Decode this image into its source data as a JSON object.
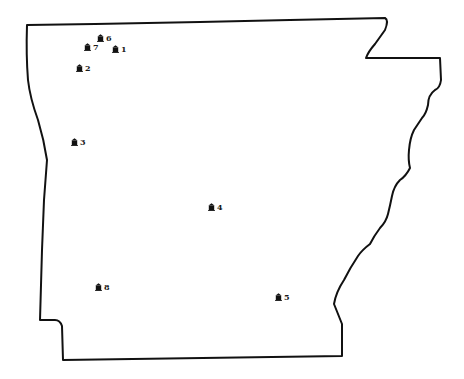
{
  "map": {
    "region": "Arkansas state outline",
    "outline_color": "#111111",
    "background_color": "#ffffff",
    "markers": [
      {
        "id": "1",
        "label": "1",
        "icon": "building-icon",
        "x": 116,
        "y": 49
      },
      {
        "id": "2",
        "label": "2",
        "icon": "building-icon",
        "x": 80,
        "y": 68
      },
      {
        "id": "3",
        "label": "3",
        "icon": "building-icon",
        "x": 75,
        "y": 142
      },
      {
        "id": "4",
        "label": "4",
        "icon": "building-icon",
        "x": 212,
        "y": 207
      },
      {
        "id": "5",
        "label": "5",
        "icon": "building-icon",
        "x": 279,
        "y": 297
      },
      {
        "id": "6",
        "label": "6",
        "icon": "building-icon",
        "x": 101,
        "y": 38
      },
      {
        "id": "7",
        "label": "7",
        "icon": "building-icon",
        "x": 88,
        "y": 47
      },
      {
        "id": "8",
        "label": "8",
        "icon": "building-icon",
        "x": 99,
        "y": 287
      }
    ]
  }
}
